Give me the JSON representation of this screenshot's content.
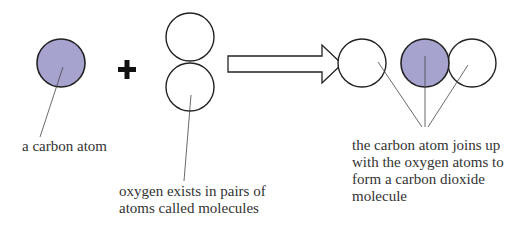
{
  "colors": {
    "carbon_fill": "#a6a3cf",
    "stroke": "#222222",
    "label_text": "#333333"
  },
  "symbols": {
    "plus": "+",
    "arrow": "right-arrow"
  },
  "labels": {
    "carbon": "a carbon atom",
    "oxygen_line1": "oxygen exists in pairs of",
    "oxygen_line2": "atoms called molecules",
    "co2_line1": "the carbon atom joins up",
    "co2_line2": "with the oxygen atoms to",
    "co2_line3": "form a carbon dioxide",
    "co2_line4": "molecule"
  }
}
